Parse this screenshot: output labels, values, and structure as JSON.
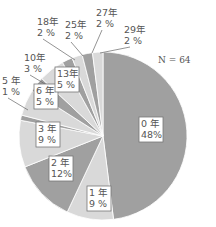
{
  "chart_data": {
    "type": "pie",
    "title": "",
    "annotation": "N = 64",
    "start_angle_deg": 0,
    "direction": "clockwise",
    "colors": {
      "dark": "#a0a0a0",
      "light": "#d9d9d9",
      "stroke": "#ffffff",
      "text": "#555555"
    },
    "slices": [
      {
        "label": "0 年",
        "value": 48,
        "pct": "48%",
        "color": "#a0a0a0"
      },
      {
        "label": "1 年",
        "value": 9,
        "pct": "9 %",
        "color": "#d9d9d9"
      },
      {
        "label": "2 年",
        "value": 12,
        "pct": "12%",
        "color": "#a0a0a0"
      },
      {
        "label": "3 年",
        "value": 9,
        "pct": "9 %",
        "color": "#d9d9d9"
      },
      {
        "label": "5 年",
        "value": 1,
        "pct": "1 %",
        "color": "#a0a0a0"
      },
      {
        "label": "6 年",
        "value": 5,
        "pct": "5 %",
        "color": "#d9d9d9"
      },
      {
        "label": "10年",
        "value": 3,
        "pct": "3 %",
        "color": "#a0a0a0"
      },
      {
        "label": "13年",
        "value": 5,
        "pct": "5 %",
        "color": "#d9d9d9"
      },
      {
        "label": "18年",
        "value": 2,
        "pct": "2 %",
        "color": "#a0a0a0"
      },
      {
        "label": "25年",
        "value": 2,
        "pct": "2 %",
        "color": "#d9d9d9"
      },
      {
        "label": "27年",
        "value": 2,
        "pct": "2 %",
        "color": "#a0a0a0"
      },
      {
        "label": "29年",
        "value": 2,
        "pct": "2 %",
        "color": "#d9d9d9"
      }
    ]
  }
}
